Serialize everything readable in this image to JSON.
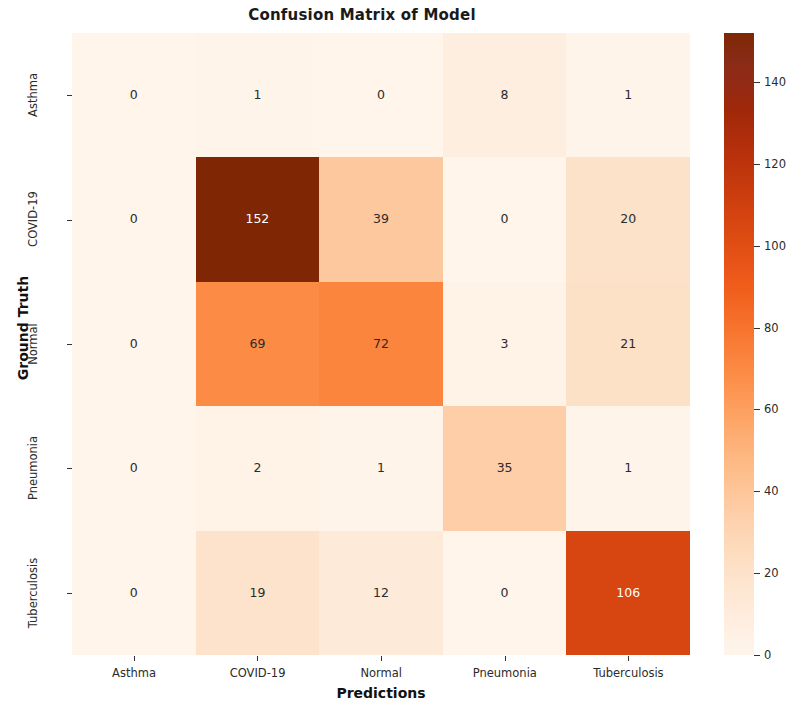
{
  "figure": {
    "title": "Confusion Matrix of Model",
    "xlabel": "Predictions",
    "ylabel": "Ground Truth"
  },
  "chart_data": {
    "type": "heatmap",
    "title": "Confusion Matrix of Model",
    "xlabel": "Predictions",
    "ylabel": "Ground Truth",
    "x_categories": [
      "Asthma",
      "COVID-19",
      "Normal",
      "Pneumonia",
      "Tuberculosis"
    ],
    "y_categories": [
      "Asthma",
      "COVID-19",
      "Normal",
      "Pneumonia",
      "Tuberculosis"
    ],
    "values": [
      [
        0,
        1,
        0,
        8,
        1
      ],
      [
        0,
        152,
        39,
        0,
        20
      ],
      [
        0,
        69,
        72,
        3,
        21
      ],
      [
        0,
        2,
        1,
        35,
        1
      ],
      [
        0,
        19,
        12,
        0,
        106
      ]
    ],
    "annotate": true,
    "colormap": "Oranges",
    "vmin": 0,
    "vmax": 152,
    "grid": false,
    "colorbar": {
      "position": "right",
      "ticks": [
        0,
        20,
        40,
        60,
        80,
        100,
        120,
        140
      ],
      "tick_labels": [
        "0",
        "20",
        "40",
        "60",
        "80",
        "100",
        "120",
        "140"
      ]
    }
  },
  "colors": {
    "cmap_low": "#fff5eb",
    "cmap_mid": "#fd8d3c",
    "cmap_high": "#7f2704",
    "text_dark": "#2b2b2b",
    "text_light": "#ffffff",
    "background": "#ffffff"
  }
}
